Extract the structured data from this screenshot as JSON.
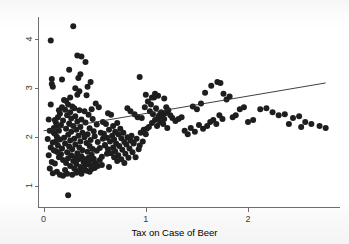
{
  "figure": {
    "background_color": "#fdfdfd",
    "point_color": "#1e1e1e",
    "line_color": "#2b2b2b",
    "axis_color": "#6d6d72"
  },
  "chart_data": {
    "type": "scatter",
    "title": "",
    "subtitle": "",
    "xlabel": "Tax on Case of Beer",
    "ylabel": "",
    "xlim": [
      -0.05,
      2.9
    ],
    "ylim": [
      0.55,
      4.45
    ],
    "xticks": [
      0,
      1,
      2
    ],
    "xtick_labels": [
      "0",
      "1",
      "2"
    ],
    "yticks": [
      1,
      2,
      3,
      4
    ],
    "ytick_labels": [
      "1",
      "2",
      "3",
      "4"
    ],
    "ytick_label_rotation": 90,
    "grid": false,
    "legend": null,
    "annotations": [],
    "series": [
      {
        "name": "observations",
        "marker": "circle",
        "marker_color": "#1e1e1e",
        "marker_size": 3.0,
        "points": [
          [
            0.07,
            3.97
          ],
          [
            0.29,
            4.26
          ],
          [
            0.08,
            3.18
          ],
          [
            0.08,
            3.08
          ],
          [
            0.09,
            3.02
          ],
          [
            0.18,
            3.17
          ],
          [
            0.07,
            2.66
          ],
          [
            0.33,
            3.66
          ],
          [
            0.37,
            3.64
          ],
          [
            0.41,
            3.53
          ],
          [
            0.25,
            3.37
          ],
          [
            0.36,
            3.28
          ],
          [
            0.34,
            3.2
          ],
          [
            0.46,
            3.12
          ],
          [
            0.31,
            2.99
          ],
          [
            0.35,
            2.93
          ],
          [
            0.33,
            2.86
          ],
          [
            0.26,
            2.8
          ],
          [
            0.42,
            2.85
          ],
          [
            0.22,
            2.73
          ],
          [
            0.2,
            2.75
          ],
          [
            0.24,
            2.66
          ],
          [
            0.28,
            2.62
          ],
          [
            0.18,
            2.6
          ],
          [
            0.3,
            2.58
          ],
          [
            0.21,
            2.55
          ],
          [
            0.35,
            2.54
          ],
          [
            0.26,
            2.5
          ],
          [
            0.4,
            2.52
          ],
          [
            0.16,
            2.47
          ],
          [
            0.23,
            2.44
          ],
          [
            0.31,
            2.42
          ],
          [
            0.44,
            2.45
          ],
          [
            0.14,
            2.4
          ],
          [
            0.27,
            2.37
          ],
          [
            0.37,
            2.35
          ],
          [
            0.19,
            2.33
          ],
          [
            0.33,
            2.31
          ],
          [
            0.48,
            2.36
          ],
          [
            0.12,
            2.29
          ],
          [
            0.25,
            2.27
          ],
          [
            0.41,
            2.29
          ],
          [
            0.17,
            2.24
          ],
          [
            0.29,
            2.22
          ],
          [
            0.36,
            2.2
          ],
          [
            0.52,
            2.25
          ],
          [
            0.1,
            2.18
          ],
          [
            0.22,
            2.16
          ],
          [
            0.32,
            2.14
          ],
          [
            0.45,
            2.17
          ],
          [
            0.15,
            2.12
          ],
          [
            0.27,
            2.1
          ],
          [
            0.38,
            2.08
          ],
          [
            0.49,
            2.11
          ],
          [
            0.11,
            2.06
          ],
          [
            0.24,
            2.04
          ],
          [
            0.34,
            2.02
          ],
          [
            0.43,
            2.05
          ],
          [
            0.56,
            2.08
          ],
          [
            0.13,
            2.0
          ],
          [
            0.2,
            1.98
          ],
          [
            0.3,
            1.96
          ],
          [
            0.4,
            1.99
          ],
          [
            0.5,
            2.01
          ],
          [
            0.16,
            1.94
          ],
          [
            0.26,
            1.92
          ],
          [
            0.36,
            1.9
          ],
          [
            0.46,
            1.93
          ],
          [
            0.58,
            1.96
          ],
          [
            0.09,
            1.88
          ],
          [
            0.21,
            1.86
          ],
          [
            0.31,
            1.84
          ],
          [
            0.42,
            1.87
          ],
          [
            0.53,
            1.89
          ],
          [
            0.14,
            1.82
          ],
          [
            0.25,
            1.8
          ],
          [
            0.35,
            1.78
          ],
          [
            0.45,
            1.81
          ],
          [
            0.6,
            1.83
          ],
          [
            0.18,
            1.76
          ],
          [
            0.28,
            1.74
          ],
          [
            0.38,
            1.72
          ],
          [
            0.48,
            1.75
          ],
          [
            0.55,
            1.77
          ],
          [
            0.12,
            1.7
          ],
          [
            0.23,
            1.68
          ],
          [
            0.33,
            1.66
          ],
          [
            0.43,
            1.69
          ],
          [
            0.52,
            1.71
          ],
          [
            0.17,
            1.64
          ],
          [
            0.27,
            1.62
          ],
          [
            0.37,
            1.6
          ],
          [
            0.47,
            1.63
          ],
          [
            0.62,
            1.65
          ],
          [
            0.15,
            1.58
          ],
          [
            0.24,
            1.56
          ],
          [
            0.34,
            1.54
          ],
          [
            0.44,
            1.57
          ],
          [
            0.57,
            1.59
          ],
          [
            0.19,
            1.52
          ],
          [
            0.29,
            1.5
          ],
          [
            0.39,
            1.48
          ],
          [
            0.49,
            1.51
          ],
          [
            0.22,
            1.46
          ],
          [
            0.32,
            1.44
          ],
          [
            0.41,
            1.42
          ],
          [
            0.51,
            1.45
          ],
          [
            0.26,
            1.4
          ],
          [
            0.36,
            1.38
          ],
          [
            0.46,
            1.41
          ],
          [
            0.3,
            1.35
          ],
          [
            0.4,
            1.33
          ],
          [
            0.5,
            1.36
          ],
          [
            0.35,
            1.3
          ],
          [
            0.45,
            1.28
          ],
          [
            0.21,
            1.32
          ],
          [
            0.24,
            0.8
          ],
          [
            0.63,
            2.48
          ],
          [
            0.66,
            2.45
          ],
          [
            0.58,
            2.3
          ],
          [
            0.61,
            2.26
          ],
          [
            0.68,
            2.22
          ],
          [
            0.72,
            2.28
          ],
          [
            0.64,
            2.14
          ],
          [
            0.7,
            2.1
          ],
          [
            0.75,
            2.16
          ],
          [
            0.59,
            2.06
          ],
          [
            0.67,
            2.02
          ],
          [
            0.73,
            2.05
          ],
          [
            0.78,
            2.08
          ],
          [
            0.62,
            1.98
          ],
          [
            0.69,
            1.94
          ],
          [
            0.76,
            1.97
          ],
          [
            0.82,
            1.99
          ],
          [
            0.65,
            1.9
          ],
          [
            0.71,
            1.86
          ],
          [
            0.79,
            1.89
          ],
          [
            0.85,
            1.92
          ],
          [
            0.6,
            1.82
          ],
          [
            0.68,
            1.78
          ],
          [
            0.74,
            1.81
          ],
          [
            0.81,
            1.84
          ],
          [
            0.88,
            1.86
          ],
          [
            0.63,
            1.74
          ],
          [
            0.7,
            1.7
          ],
          [
            0.77,
            1.73
          ],
          [
            0.84,
            1.76
          ],
          [
            0.66,
            1.66
          ],
          [
            0.73,
            1.62
          ],
          [
            0.8,
            1.65
          ],
          [
            0.87,
            1.68
          ],
          [
            0.69,
            1.58
          ],
          [
            0.76,
            1.54
          ],
          [
            0.83,
            1.57
          ],
          [
            0.72,
            1.5
          ],
          [
            0.79,
            1.46
          ],
          [
            0.57,
            1.42
          ],
          [
            0.64,
            1.38
          ],
          [
            0.9,
            1.58
          ],
          [
            0.93,
            1.74
          ],
          [
            0.86,
            2.02
          ],
          [
            0.91,
            1.96
          ],
          [
            0.95,
            2.08
          ],
          [
            0.98,
            2.14
          ],
          [
            0.88,
            1.88
          ],
          [
            0.94,
            1.82
          ],
          [
            0.97,
            1.9
          ],
          [
            1.0,
            2.05
          ],
          [
            0.92,
            2.4
          ],
          [
            0.89,
            2.46
          ],
          [
            0.96,
            2.38
          ],
          [
            0.85,
            2.52
          ],
          [
            0.82,
            2.58
          ],
          [
            0.99,
            2.6
          ],
          [
            1.02,
            2.72
          ],
          [
            1.05,
            2.66
          ],
          [
            1.08,
            2.8
          ],
          [
            1.04,
            2.52
          ],
          [
            1.07,
            2.46
          ],
          [
            1.1,
            2.58
          ],
          [
            1.13,
            2.44
          ],
          [
            1.12,
            2.38
          ],
          [
            1.15,
            2.5
          ],
          [
            1.09,
            2.34
          ],
          [
            1.16,
            2.42
          ],
          [
            1.18,
            2.36
          ],
          [
            1.2,
            2.6
          ],
          [
            1.22,
            2.54
          ],
          [
            1.19,
            2.48
          ],
          [
            1.14,
            2.3
          ],
          [
            1.17,
            2.26
          ],
          [
            1.11,
            2.22
          ],
          [
            1.06,
            2.28
          ],
          [
            1.03,
            2.2
          ],
          [
            1.01,
            2.16
          ],
          [
            1.21,
            2.18
          ],
          [
            1.24,
            2.44
          ],
          [
            1.26,
            2.38
          ],
          [
            0.94,
            3.22
          ],
          [
            1.0,
            2.86
          ],
          [
            1.06,
            2.8
          ],
          [
            1.12,
            2.84
          ],
          [
            1.18,
            2.78
          ],
          [
            1.09,
            2.88
          ],
          [
            1.29,
            2.32
          ],
          [
            1.32,
            2.36
          ],
          [
            1.35,
            2.4
          ],
          [
            1.38,
            2.12
          ],
          [
            1.41,
            2.05
          ],
          [
            1.44,
            2.18
          ],
          [
            1.48,
            2.1
          ],
          [
            1.52,
            2.24
          ],
          [
            1.56,
            2.16
          ],
          [
            1.46,
            2.62
          ],
          [
            1.5,
            2.56
          ],
          [
            1.54,
            2.68
          ],
          [
            1.6,
            2.22
          ],
          [
            1.63,
            2.3
          ],
          [
            1.66,
            2.34
          ],
          [
            1.69,
            2.26
          ],
          [
            1.58,
            2.9
          ],
          [
            1.64,
            3.04
          ],
          [
            1.7,
            3.12
          ],
          [
            1.73,
            3.1
          ],
          [
            1.76,
            2.88
          ],
          [
            1.79,
            2.76
          ],
          [
            1.82,
            2.82
          ],
          [
            1.85,
            2.4
          ],
          [
            1.88,
            2.44
          ],
          [
            1.72,
            2.44
          ],
          [
            1.75,
            2.36
          ],
          [
            1.92,
            2.56
          ],
          [
            1.96,
            2.6
          ],
          [
            2.0,
            2.3
          ],
          [
            2.05,
            2.34
          ],
          [
            2.12,
            2.56
          ],
          [
            2.18,
            2.58
          ],
          [
            2.24,
            2.5
          ],
          [
            2.3,
            2.44
          ],
          [
            2.36,
            2.46
          ],
          [
            2.44,
            2.38
          ],
          [
            2.5,
            2.42
          ],
          [
            2.56,
            2.3
          ],
          [
            2.62,
            2.26
          ],
          [
            2.7,
            2.22
          ],
          [
            2.76,
            2.18
          ],
          [
            2.4,
            2.26
          ],
          [
            2.52,
            2.2
          ],
          [
            0.05,
            2.35
          ],
          [
            0.06,
            2.12
          ],
          [
            0.04,
            1.95
          ],
          [
            0.07,
            1.78
          ],
          [
            0.05,
            1.62
          ],
          [
            0.08,
            1.48
          ],
          [
            0.06,
            1.35
          ],
          [
            0.09,
            1.25
          ],
          [
            0.11,
            1.45
          ],
          [
            0.13,
            1.28
          ],
          [
            0.16,
            1.22
          ],
          [
            0.19,
            1.2
          ],
          [
            0.23,
            1.24
          ],
          [
            0.28,
            1.22
          ],
          [
            0.32,
            1.26
          ],
          [
            0.37,
            1.24
          ],
          [
            0.42,
            1.3
          ],
          [
            0.47,
            1.34
          ],
          [
            0.53,
            1.4
          ],
          [
            0.55,
            1.52
          ],
          [
            0.49,
            1.55
          ],
          [
            0.44,
            1.5
          ],
          [
            0.39,
            1.55
          ],
          [
            0.31,
            1.58
          ],
          [
            0.14,
            1.68
          ],
          [
            0.1,
            1.72
          ],
          [
            0.12,
            1.9
          ],
          [
            0.1,
            2.08
          ],
          [
            0.13,
            2.2
          ],
          [
            0.11,
            2.34
          ],
          [
            0.15,
            2.54
          ],
          [
            0.43,
            3.02
          ],
          [
            0.51,
            2.68
          ],
          [
            0.54,
            2.6
          ],
          [
            0.47,
            2.56
          ]
        ]
      }
    ],
    "fit_line": {
      "name": "linear-fit",
      "x_start": 0.0,
      "y_start": 2.12,
      "x_end": 2.76,
      "y_end": 3.1,
      "slope": 0.355,
      "intercept": 2.12
    }
  }
}
